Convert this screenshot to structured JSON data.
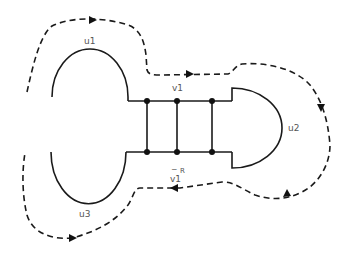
{
  "diagram": {
    "labels": {
      "u1": "u1",
      "u2": "u2",
      "u3": "u3",
      "v1": "v1",
      "v1_reverse_base": "v1",
      "v1_reverse_bar": "‾",
      "v1_reverse_sup": "R"
    },
    "components": [
      {
        "id": "u1",
        "shape": "upper semicircle loop",
        "position": "top-left"
      },
      {
        "id": "u2",
        "shape": "right semicircle loop",
        "position": "right"
      },
      {
        "id": "u3",
        "shape": "lower semicircle loop",
        "position": "bottom-left"
      },
      {
        "id": "ladder",
        "shape": "two horizontal rails with three vertical rungs",
        "nodes": 6
      }
    ],
    "path": {
      "style": "dashed",
      "direction": "clockwise",
      "arrows": 5
    },
    "colors": {
      "stroke": "#1a1a1a",
      "label": "#555555",
      "background": "#ffffff"
    }
  }
}
